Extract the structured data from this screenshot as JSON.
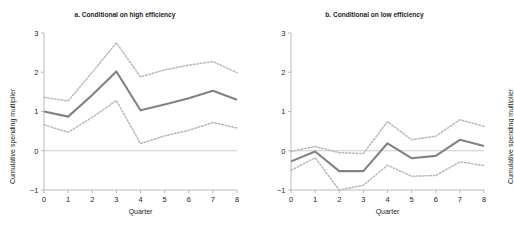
{
  "figure": {
    "main_title": "",
    "background_color": "#ffffff"
  },
  "panels": [
    {
      "key": "a",
      "title": "a. Conditional on high efficiency",
      "xlabel": "Quarter",
      "ylabel": "Cumulative spending multiplier"
    },
    {
      "key": "b",
      "title": "b. Conditional on low efficiency",
      "xlabel": "Quarter",
      "ylabel": "Cumulative spending multiplier"
    }
  ],
  "axis": {
    "y_ticks": [
      "3",
      "2",
      "1",
      "0",
      "-1"
    ],
    "x_ticks": [
      "0",
      "1",
      "2",
      "3",
      "4",
      "5",
      "6",
      "7",
      "8"
    ]
  },
  "colors": {
    "central_line": "#808285",
    "confidence_band": "#b6b8ba",
    "axis": "#a7a9ac",
    "zero_line": "#bcbec0",
    "text": "#231f20"
  },
  "chart_data": [
    {
      "type": "line",
      "title": "a. Conditional on high efficiency",
      "xlabel": "Quarter",
      "ylabel": "Cumulative spending multiplier",
      "xlim": [
        0,
        8
      ],
      "ylim": [
        -1,
        3
      ],
      "yticks": [
        -1,
        0,
        1,
        2,
        3
      ],
      "xticks": [
        0,
        1,
        2,
        3,
        4,
        5,
        6,
        7,
        8
      ],
      "grid": false,
      "legend": "none",
      "zero_reference_line": 0,
      "x": [
        0,
        1,
        2,
        3,
        4,
        5,
        6,
        7,
        8
      ],
      "series": [
        {
          "name": "Cumulative spending multiplier",
          "style": "solid",
          "values": [
            1.0,
            0.87,
            1.42,
            2.02,
            1.03,
            1.18,
            1.34,
            1.53,
            1.3
          ]
        },
        {
          "name": "Upper confidence band",
          "style": "dotted",
          "values": [
            1.36,
            1.27,
            2.0,
            2.75,
            1.88,
            2.06,
            2.18,
            2.27,
            1.99
          ]
        },
        {
          "name": "Lower confidence band",
          "style": "dotted",
          "values": [
            0.66,
            0.47,
            0.85,
            1.28,
            0.18,
            0.38,
            0.52,
            0.72,
            0.58
          ]
        }
      ]
    },
    {
      "type": "line",
      "title": "b. Conditional on low efficiency",
      "xlabel": "Quarter",
      "ylabel": "Cumulative spending multiplier",
      "xlim": [
        0,
        8
      ],
      "ylim": [
        -1,
        3
      ],
      "yticks": [
        -1,
        0,
        1,
        2,
        3
      ],
      "xticks": [
        0,
        1,
        2,
        3,
        4,
        5,
        6,
        7,
        8
      ],
      "grid": false,
      "legend": "none",
      "zero_reference_line": 0,
      "x": [
        0,
        1,
        2,
        3,
        4,
        5,
        6,
        7,
        8
      ],
      "series": [
        {
          "name": "Cumulative spending multiplier",
          "style": "solid",
          "values": [
            -0.27,
            -0.02,
            -0.52,
            -0.52,
            0.19,
            -0.19,
            -0.13,
            0.28,
            0.12
          ]
        },
        {
          "name": "Upper confidence band",
          "style": "dotted",
          "values": [
            -0.02,
            0.11,
            -0.05,
            -0.07,
            0.74,
            0.28,
            0.37,
            0.79,
            0.62
          ]
        },
        {
          "name": "Lower confidence band",
          "style": "dotted",
          "values": [
            -0.5,
            -0.18,
            -1.0,
            -0.88,
            -0.37,
            -0.65,
            -0.63,
            -0.28,
            -0.38
          ]
        }
      ]
    }
  ]
}
